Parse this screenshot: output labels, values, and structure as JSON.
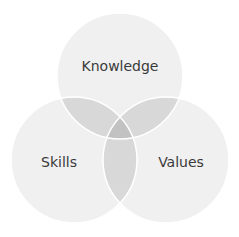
{
  "diagram": {
    "type": "venn",
    "sets": [
      {
        "label": "Knowledge",
        "cx": 120,
        "cy": 76,
        "r": 63
      },
      {
        "label": "Skills",
        "cx": 74,
        "cy": 160,
        "r": 63
      },
      {
        "label": "Values",
        "cx": 166,
        "cy": 160,
        "r": 63
      }
    ],
    "colors": {
      "circle": "#f0f0f0",
      "pair_overlap": "#d8d8d8",
      "center_overlap": "#c2c2c2",
      "stroke": "#ffffff",
      "text": "#3a3a3a"
    }
  }
}
